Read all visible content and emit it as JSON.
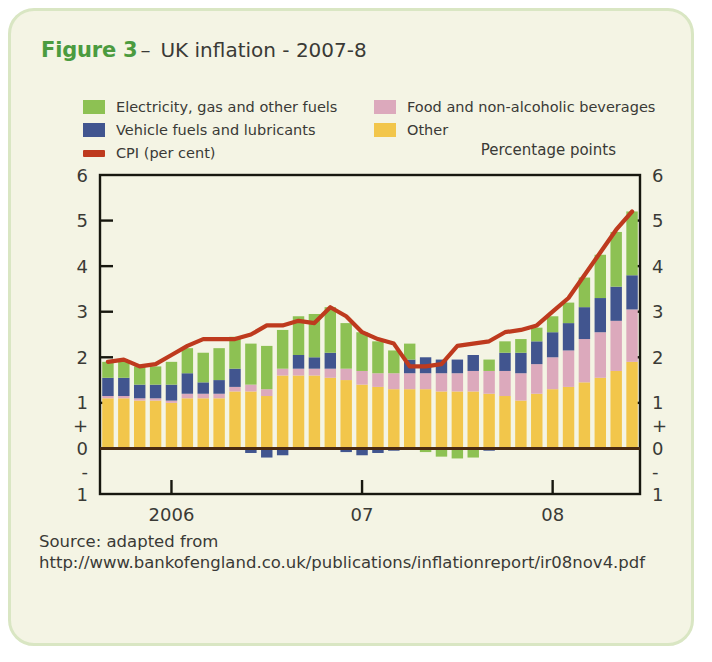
{
  "card": {
    "background": "#F4F4E4",
    "border_color": "#D9E6C3"
  },
  "title": {
    "figure_label": "Figure 3",
    "dash": "–",
    "text": "UK inflation - 2007-8",
    "figure_label_color": "#4B9B3F"
  },
  "legend": {
    "items": [
      {
        "label": "Electricity, gas and other fuels",
        "color": "#8DC153",
        "type": "swatch"
      },
      {
        "label": "Vehicle fuels and lubricants",
        "color": "#41558F",
        "type": "swatch"
      },
      {
        "label": "CPI (per cent)",
        "color": "#BE3A1E",
        "type": "line"
      },
      {
        "label": "Food and non-alcoholic beverages",
        "color": "#DCA9BC",
        "type": "swatch"
      },
      {
        "label": "Other",
        "color": "#F2C64B",
        "type": "swatch"
      }
    ]
  },
  "units_label": "Percentage points",
  "source": {
    "line1": "Source: adapted from",
    "line2": "http://www.bankofengland.co.uk/publications/inflationreport/ir08nov4.pdf"
  },
  "chart_data": {
    "type": "bar",
    "title": "UK inflation - 2007-8",
    "subtitle": "",
    "xlabel": "",
    "ylabel": "Percentage points",
    "ylim": [
      -1,
      6
    ],
    "yticks": [
      -1,
      0,
      1,
      2,
      3,
      4,
      5,
      6
    ],
    "ytick_labels": [
      "1",
      "0",
      "1",
      "2",
      "3",
      "4",
      "5",
      "6"
    ],
    "y_sign_markers": {
      "plus_between": [
        0,
        1
      ],
      "minus_between": [
        -1,
        0
      ]
    },
    "grid": false,
    "legend_position": "above-plot",
    "stacked": true,
    "axis_tick_positions": {
      "2006": 4,
      "07": 16,
      "08": 28
    },
    "x_tick_labels": [
      "2006",
      "07",
      "08"
    ],
    "categories": [
      "2005 M1",
      "2005 M2",
      "2005 M3",
      "2005 M4",
      "2005 M5",
      "2005 M6",
      "2006 M1",
      "2006 M2",
      "2006 M3",
      "2006 M4",
      "2006 M5",
      "2006 M6",
      "2006 M7",
      "2006 M8",
      "2006 M9",
      "2006 M10",
      "2006 M11",
      "2006 M12",
      "2007 M1",
      "2007 M2",
      "2007 M3",
      "2007 M4",
      "2007 M5",
      "2007 M6",
      "2007 M7",
      "2007 M8",
      "2007 M9",
      "2007 M10",
      "2007 M11",
      "2007 M12",
      "2008 M1",
      "2008 M2",
      "2008 M3",
      "2008 M4"
    ],
    "series": [
      {
        "name": "Other",
        "color": "#F2C64B",
        "values": [
          1.1,
          1.1,
          1.05,
          1.05,
          1.0,
          1.1,
          1.1,
          1.1,
          1.25,
          1.25,
          1.15,
          1.6,
          1.6,
          1.6,
          1.55,
          1.5,
          1.4,
          1.35,
          1.3,
          1.3,
          1.3,
          1.25,
          1.25,
          1.25,
          1.2,
          1.15,
          1.05,
          1.2,
          1.3,
          1.35,
          1.45,
          1.55,
          1.7,
          1.9
        ]
      },
      {
        "name": "Food and non-alcoholic beverages",
        "color": "#DCA9BC",
        "values": [
          0.05,
          0.05,
          0.05,
          0.05,
          0.05,
          0.1,
          0.1,
          0.1,
          0.1,
          0.15,
          0.15,
          0.15,
          0.15,
          0.15,
          0.2,
          0.25,
          0.3,
          0.3,
          0.35,
          0.35,
          0.35,
          0.4,
          0.4,
          0.45,
          0.5,
          0.55,
          0.6,
          0.65,
          0.7,
          0.8,
          0.95,
          1.0,
          1.1,
          1.15
        ]
      },
      {
        "name": "Vehicle fuels and lubricants",
        "color": "#41558F",
        "values": [
          0.4,
          0.4,
          0.3,
          0.3,
          0.35,
          0.45,
          0.25,
          0.3,
          0.4,
          -0.1,
          -0.2,
          -0.15,
          0.3,
          0.25,
          0.35,
          -0.08,
          -0.15,
          -0.1,
          -0.05,
          0.3,
          0.35,
          0.3,
          0.3,
          0.35,
          -0.05,
          0.4,
          0.45,
          0.5,
          0.55,
          0.6,
          0.7,
          0.75,
          0.75,
          0.75
        ]
      },
      {
        "name": "Electricity, gas and other fuels",
        "color": "#8DC153",
        "values": [
          0.35,
          0.35,
          0.4,
          0.4,
          0.5,
          0.55,
          0.65,
          0.7,
          0.7,
          0.9,
          0.95,
          0.85,
          0.85,
          0.95,
          1.0,
          1.0,
          0.85,
          0.7,
          0.5,
          0.35,
          -0.08,
          -0.18,
          -0.22,
          -0.2,
          0.25,
          0.25,
          0.3,
          0.3,
          0.35,
          0.45,
          0.65,
          0.95,
          1.2,
          1.4
        ]
      }
    ],
    "line_series": {
      "name": "CPI (per cent)",
      "color": "#BE3A1E",
      "values": [
        1.9,
        1.95,
        1.8,
        1.85,
        2.05,
        2.25,
        2.4,
        2.4,
        2.4,
        2.5,
        2.7,
        2.7,
        2.8,
        2.75,
        3.1,
        2.9,
        2.55,
        2.4,
        2.3,
        1.8,
        1.8,
        1.85,
        2.25,
        2.3,
        2.35,
        2.55,
        2.6,
        2.7,
        3.0,
        3.3,
        3.8,
        4.3,
        4.8,
        5.2
      ]
    }
  }
}
